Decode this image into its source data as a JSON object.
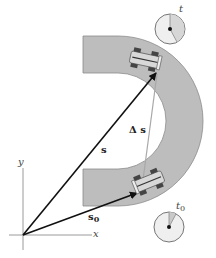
{
  "diagram": {
    "colors": {
      "track": "#bdbdbd",
      "track_edge": "#8a8a8a",
      "vector": "#111111",
      "displacement": "#a8a8a8",
      "axis": "#999999",
      "clock_face": "#efefef",
      "clock_sector": "#cfcfcf"
    },
    "labels": {
      "s": "s",
      "s0_main": "s",
      "s0_sub": "0",
      "delta_s": "Δ s",
      "x_axis": "x",
      "y_axis": "y",
      "clock_t": "t",
      "clock_t0_main": "t",
      "clock_t0_sub": "0"
    },
    "clocks": [
      {
        "name": "clock-t",
        "label": "t",
        "cx": 170,
        "cy": 29,
        "r": 15
      },
      {
        "name": "clock-t0",
        "label": "t0",
        "cx": 169,
        "cy": 227,
        "r": 15
      }
    ],
    "icons": [
      "race-car-icon",
      "race-car-icon",
      "clock-icon",
      "clock-icon"
    ]
  }
}
